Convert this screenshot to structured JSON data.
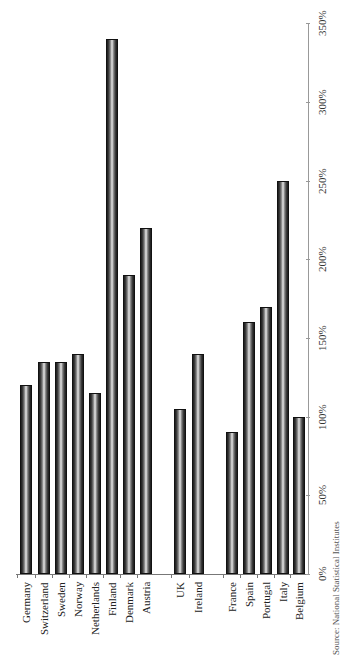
{
  "chart_data": {
    "type": "bar",
    "orientation": "vertical (page rotated 90°)",
    "title": "",
    "xlabel": "",
    "ylabel": "",
    "ylim": [
      0,
      350
    ],
    "y_ticks": [
      "0%",
      "50%",
      "100%",
      "150%",
      "200%",
      "250%",
      "300%",
      "350%"
    ],
    "grid": false,
    "legend": null,
    "groups": [
      {
        "name": "group-1",
        "categories": [
          "Germany",
          "Switzerland",
          "Sweden",
          "Norway",
          "Netherlands",
          "Finland",
          "Denmark",
          "Austria"
        ]
      },
      {
        "name": "group-2",
        "categories": [
          "UK",
          "Ireland"
        ]
      },
      {
        "name": "group-3",
        "categories": [
          "France",
          "Spain",
          "Portugal",
          "Italy",
          "Belgium"
        ]
      }
    ],
    "categories": [
      "Germany",
      "Switzerland",
      "Sweden",
      "Norway",
      "Netherlands",
      "Finland",
      "Denmark",
      "Austria",
      "UK",
      "Ireland",
      "France",
      "Spain",
      "Portugal",
      "Italy",
      "Belgium"
    ],
    "values": [
      120,
      135,
      135,
      140,
      115,
      340,
      190,
      220,
      105,
      140,
      90,
      160,
      170,
      250,
      100
    ],
    "unit": "%"
  },
  "layout": {
    "baseline_y": 574,
    "px_per_unit": 1.573,
    "bar_width": 12,
    "bar_centers_x": [
      26,
      44,
      61,
      78,
      95,
      112,
      129,
      146,
      180,
      198,
      232,
      249,
      266,
      283,
      299
    ],
    "axis_x_start": 16,
    "axis_x_end": 308
  },
  "source_note": "Source: National Statistical Institutes"
}
